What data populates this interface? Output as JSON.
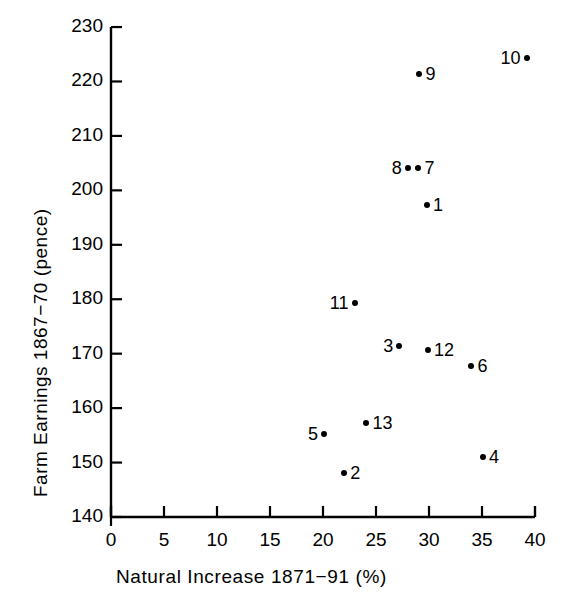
{
  "chart_data": {
    "type": "scatter",
    "title": "",
    "xlabel": "Natural  Increase  1871−91  (%)",
    "ylabel": "Farm Earnings 1867−70 (pence)",
    "xlim": [
      0,
      40
    ],
    "ylim": [
      140,
      230
    ],
    "xticks": [
      0,
      5,
      10,
      15,
      20,
      25,
      30,
      35,
      40
    ],
    "yticks": [
      140,
      150,
      160,
      170,
      180,
      190,
      200,
      210,
      220,
      230
    ],
    "xtick_labels": [
      "0",
      "5",
      "10",
      "15",
      "20",
      "25",
      "30",
      "35",
      "40"
    ],
    "ytick_labels": [
      "140",
      "150",
      "160",
      "170",
      "180",
      "190",
      "200",
      "210",
      "220",
      "230"
    ],
    "grid": false,
    "legend": false,
    "marker_color": "#000000",
    "axis_color": "#000000",
    "points": [
      {
        "label": "1",
        "x": 29.8,
        "y": 197.4,
        "label_side": "right"
      },
      {
        "label": "2",
        "x": 22.0,
        "y": 148.1,
        "label_side": "right"
      },
      {
        "label": "3",
        "x": 27.2,
        "y": 171.4,
        "label_side": "left"
      },
      {
        "label": "4",
        "x": 35.1,
        "y": 151.0,
        "label_side": "right"
      },
      {
        "label": "5",
        "x": 20.1,
        "y": 155.3,
        "label_side": "left"
      },
      {
        "label": "6",
        "x": 34.0,
        "y": 167.8,
        "label_side": "right"
      },
      {
        "label": "7",
        "x": 29.0,
        "y": 204.1,
        "label_side": "right"
      },
      {
        "label": "8",
        "x": 28.0,
        "y": 204.1,
        "label_side": "left"
      },
      {
        "label": "9",
        "x": 29.1,
        "y": 221.4,
        "label_side": "right"
      },
      {
        "label": "10",
        "x": 39.2,
        "y": 224.4,
        "label_side": "left"
      },
      {
        "label": "11",
        "x": 23.0,
        "y": 179.3,
        "label_side": "left"
      },
      {
        "label": "12",
        "x": 29.9,
        "y": 170.7,
        "label_side": "right"
      },
      {
        "label": "13",
        "x": 24.1,
        "y": 157.3,
        "label_side": "right"
      }
    ]
  },
  "plot_geometry": {
    "origin_x_px": 111,
    "origin_y_px": 517,
    "px_per_x_unit": 10.6,
    "px_per_y_unit": 5.444,
    "top_y_px": 27,
    "right_x_px": 535
  }
}
